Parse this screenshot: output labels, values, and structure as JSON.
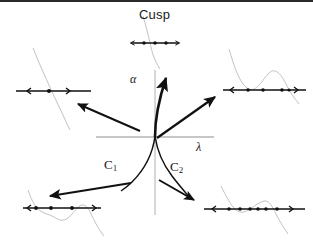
{
  "figure": {
    "title_label": "Cusp",
    "background_color": "#ffffff",
    "ink_color": "#111111",
    "faint_curve_color": "#b9b9b9",
    "axis_color": "#8d8d8d",
    "width": 313,
    "height": 244,
    "top_rule": true
  },
  "axes": {
    "vertical_label": "α",
    "horizontal_label": "λ",
    "origin": {
      "x": 155,
      "y": 137
    }
  },
  "branches": [
    {
      "name": "C1",
      "label": "C",
      "subscript": "1",
      "side": "left"
    },
    {
      "name": "C2",
      "label": "C",
      "subscript": "2",
      "side": "right"
    }
  ],
  "arrows": [
    {
      "name": "arrow-to-top-left",
      "from": [
        136,
        131
      ],
      "to": [
        74,
        107
      ],
      "target": "inset-top-left"
    },
    {
      "name": "arrow-to-top-right",
      "from": [
        168,
        139
      ],
      "to": [
        214,
        96
      ],
      "target": "inset-top-right"
    },
    {
      "name": "arrow-to-top-center",
      "from": [
        155,
        133
      ],
      "to": [
        163,
        60
      ],
      "target": "inset-top-center"
    },
    {
      "name": "arrow-to-bottom-left",
      "from": [
        127,
        181
      ],
      "to": [
        49,
        194
      ],
      "target": "inset-bottom-left"
    },
    {
      "name": "arrow-to-bottom-right",
      "from": [
        158,
        177
      ],
      "to": [
        196,
        200
      ],
      "target": "inset-bottom-right"
    }
  ],
  "insets": [
    {
      "name": "inset-top-center",
      "position": [
        128,
        36
      ],
      "line": {
        "x1": 131,
        "x2": 178,
        "y": 43
      },
      "roots": [
        143,
        155,
        166
      ],
      "root_count": 3,
      "curve_shape": "steep-descending",
      "caption": "Cusp"
    },
    {
      "name": "inset-top-left",
      "position": [
        16,
        88
      ],
      "line": {
        "x1": 17,
        "x2": 90,
        "y": 91
      },
      "roots": [
        28,
        50,
        68
      ],
      "root_count": 3,
      "curve_shape": "descending-line",
      "caption": ""
    },
    {
      "name": "inset-top-right",
      "position": [
        224,
        88
      ],
      "line": {
        "x1": 224,
        "x2": 305,
        "y": 90
      },
      "roots": [
        231,
        249,
        267,
        284,
        295
      ],
      "root_count": 5,
      "curve_shape": "w-with-local-max",
      "caption": ""
    },
    {
      "name": "inset-bottom-left",
      "position": [
        23,
        206
      ],
      "line": {
        "x1": 24,
        "x2": 100,
        "y": 208
      },
      "roots": [
        31,
        44,
        63,
        81,
        92
      ],
      "root_count": 5,
      "curve_shape": "cubic-wave",
      "caption": ""
    },
    {
      "name": "inset-bottom-right",
      "position": [
        206,
        207
      ],
      "line": {
        "x1": 206,
        "x2": 303,
        "y": 209
      },
      "roots": [
        214,
        229,
        241,
        252,
        262,
        272,
        286
      ],
      "root_count": 7,
      "curve_shape": "multi-wave",
      "caption": ""
    }
  ]
}
